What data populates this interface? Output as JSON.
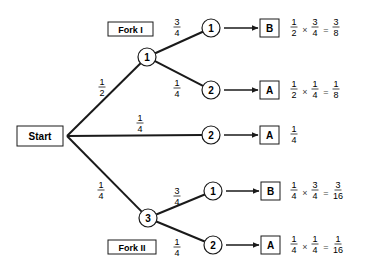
{
  "diagram": {
    "type": "probability-tree",
    "start": {
      "label": "Start",
      "x": 17,
      "y": 126,
      "w": 46,
      "h": 20,
      "anchor": [
        67,
        136
      ]
    },
    "forks": [
      {
        "label": "Fork I",
        "x": 108,
        "y": 22,
        "w": 45,
        "h": 14
      },
      {
        "label": "Fork II",
        "x": 108,
        "y": 240,
        "w": 48,
        "h": 14
      }
    ],
    "nodes": [
      {
        "id": "fork1",
        "label": "1",
        "x": 147,
        "y": 57
      },
      {
        "id": "fork1-out1",
        "label": "1",
        "x": 211,
        "y": 28
      },
      {
        "id": "fork1-out2",
        "label": "2",
        "x": 211,
        "y": 90
      },
      {
        "id": "mid-out2",
        "label": "2",
        "x": 211,
        "y": 135
      },
      {
        "id": "fork3",
        "label": "3",
        "x": 148,
        "y": 218
      },
      {
        "id": "fork3-out1",
        "label": "1",
        "x": 213,
        "y": 191
      },
      {
        "id": "fork3-out2",
        "label": "2",
        "x": 213,
        "y": 245
      }
    ],
    "edges": [
      {
        "from": [
          67,
          136
        ],
        "to": [
          147,
          57
        ],
        "prob": {
          "num": "1",
          "den": "2",
          "x": 102,
          "y": 87
        }
      },
      {
        "from": [
          67,
          136
        ],
        "to": [
          211,
          135
        ],
        "prob": {
          "num": "1",
          "den": "4",
          "x": 140,
          "y": 123
        }
      },
      {
        "from": [
          67,
          136
        ],
        "to": [
          148,
          218
        ],
        "prob": {
          "num": "1",
          "den": "4",
          "x": 101,
          "y": 190
        }
      },
      {
        "from": [
          147,
          57
        ],
        "to": [
          211,
          28
        ],
        "prob": {
          "num": "3",
          "den": "4",
          "x": 177,
          "y": 27
        }
      },
      {
        "from": [
          147,
          57
        ],
        "to": [
          211,
          90
        ],
        "prob": {
          "num": "1",
          "den": "4",
          "x": 177,
          "y": 88
        }
      },
      {
        "from": [
          148,
          218
        ],
        "to": [
          213,
          191
        ],
        "prob": {
          "num": "3",
          "den": "4",
          "x": 177,
          "y": 196
        }
      },
      {
        "from": [
          148,
          218
        ],
        "to": [
          213,
          245
        ],
        "prob": {
          "num": "1",
          "den": "4",
          "x": 177,
          "y": 247
        }
      }
    ],
    "outcomes": [
      {
        "label": "B",
        "node_x": 211,
        "y": 28,
        "box_x": 260,
        "formula": {
          "terms": [
            [
              "1",
              "2"
            ],
            [
              "3",
              "4"
            ]
          ],
          "result": [
            "3",
            "8"
          ]
        }
      },
      {
        "label": "A",
        "node_x": 211,
        "y": 90,
        "box_x": 260,
        "formula": {
          "terms": [
            [
              "1",
              "2"
            ],
            [
              "1",
              "4"
            ]
          ],
          "result": [
            "1",
            "8"
          ]
        }
      },
      {
        "label": "A",
        "node_x": 211,
        "y": 135,
        "box_x": 260,
        "formula": {
          "terms": [
            [
              "1",
              "4"
            ]
          ],
          "result": null
        }
      },
      {
        "label": "B",
        "node_x": 213,
        "y": 191,
        "box_x": 261,
        "formula": {
          "terms": [
            [
              "1",
              "4"
            ],
            [
              "3",
              "4"
            ]
          ],
          "result": [
            "3",
            "16"
          ]
        }
      },
      {
        "label": "A",
        "node_x": 213,
        "y": 245,
        "box_x": 261,
        "formula": {
          "terms": [
            [
              "1",
              "4"
            ],
            [
              "1",
              "4"
            ]
          ],
          "result": [
            "1",
            "16"
          ]
        }
      }
    ],
    "operators": {
      "times": "×",
      "equals": "="
    }
  }
}
